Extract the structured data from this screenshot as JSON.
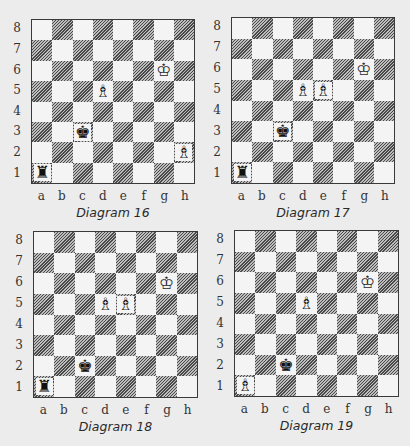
{
  "files": [
    "a",
    "b",
    "c",
    "d",
    "e",
    "f",
    "g",
    "h"
  ],
  "ranks": [
    "8",
    "7",
    "6",
    "5",
    "4",
    "3",
    "2",
    "1"
  ],
  "glyphs": {
    "white-king": "♔",
    "white-bishop": "♗",
    "black-king": "♚",
    "black-rook": "♜"
  },
  "diagrams": [
    {
      "caption": "Diagram 16",
      "board": {
        "x": 31,
        "y": 19,
        "w": 164,
        "h": 165
      },
      "pieces": [
        {
          "square": "g6",
          "type": "white-king"
        },
        {
          "square": "d5",
          "type": "white-bishop"
        },
        {
          "square": "h2",
          "type": "white-bishop"
        },
        {
          "square": "c3",
          "type": "black-king"
        },
        {
          "square": "a1",
          "type": "black-rook"
        }
      ]
    },
    {
      "caption": "Diagram 17",
      "board": {
        "x": 231,
        "y": 17,
        "w": 164,
        "h": 167
      },
      "pieces": [
        {
          "square": "g6",
          "type": "white-king"
        },
        {
          "square": "d5",
          "type": "white-bishop"
        },
        {
          "square": "e5",
          "type": "white-bishop"
        },
        {
          "square": "c3",
          "type": "black-king"
        },
        {
          "square": "a1",
          "type": "black-rook"
        }
      ]
    },
    {
      "caption": "Diagram 18",
      "board": {
        "x": 33,
        "y": 231,
        "w": 165,
        "h": 167
      },
      "pieces": [
        {
          "square": "g6",
          "type": "white-king"
        },
        {
          "square": "d5",
          "type": "white-bishop"
        },
        {
          "square": "e5",
          "type": "white-bishop"
        },
        {
          "square": "c2",
          "type": "black-king"
        },
        {
          "square": "a1",
          "type": "black-rook"
        }
      ]
    },
    {
      "caption": "Diagram 19",
      "board": {
        "x": 234,
        "y": 230,
        "w": 165,
        "h": 167
      },
      "pieces": [
        {
          "square": "g6",
          "type": "white-king"
        },
        {
          "square": "d5",
          "type": "white-bishop"
        },
        {
          "square": "a1",
          "type": "white-bishop"
        },
        {
          "square": "c2",
          "type": "black-king"
        }
      ]
    }
  ]
}
